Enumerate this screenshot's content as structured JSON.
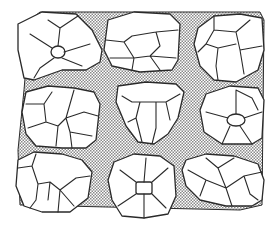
{
  "figure": {
    "grid": {
      "rows": 3,
      "cols": 3
    },
    "colors": {
      "line": "#2a2a2a",
      "block_fill": "#ffffff",
      "matrix_dark": "#8a8a8a",
      "matrix_light": "#ffffff"
    },
    "blocks": [
      {
        "row": 1,
        "col": 1,
        "label": "block-top-left"
      },
      {
        "row": 1,
        "col": 2,
        "label": "block-top-center"
      },
      {
        "row": 1,
        "col": 3,
        "label": "block-top-right"
      },
      {
        "row": 2,
        "col": 1,
        "label": "block-middle-left"
      },
      {
        "row": 2,
        "col": 2,
        "label": "block-middle-center"
      },
      {
        "row": 2,
        "col": 3,
        "label": "block-middle-right"
      },
      {
        "row": 3,
        "col": 1,
        "label": "block-bottom-left"
      },
      {
        "row": 3,
        "col": 2,
        "label": "block-bottom-center"
      },
      {
        "row": 3,
        "col": 3,
        "label": "block-bottom-right"
      }
    ]
  }
}
